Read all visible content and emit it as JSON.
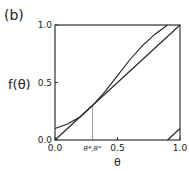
{
  "chart_data": {
    "type": "line",
    "panel_label": "(b)",
    "title": "",
    "xlabel": "θ",
    "ylabel": "f(θ)",
    "xlim": [
      0.0,
      1.0
    ],
    "ylim": [
      0.0,
      1.0
    ],
    "xticks": [
      {
        "v": 0.0,
        "label": "0.0"
      },
      {
        "v": 0.5,
        "label": "0.5"
      },
      {
        "v": 1.0,
        "label": "1.0"
      }
    ],
    "yticks": [
      {
        "v": 0.0,
        "label": "0.0"
      },
      {
        "v": 0.5,
        "label": "0.5"
      },
      {
        "v": 1.0,
        "label": "1.0"
      }
    ],
    "grid": false,
    "annotation": {
      "label": "θ*,θ°",
      "x": 0.3,
      "y": 0.3
    },
    "series": [
      {
        "name": "diagonal",
        "x": [
          0.0,
          1.0
        ],
        "y": [
          0.0,
          1.0
        ]
      },
      {
        "name": "f-branch-1",
        "x": [
          0.0,
          0.1,
          0.2,
          0.3,
          0.4,
          0.5,
          0.6,
          0.7,
          0.8,
          0.9
        ],
        "y": [
          0.1,
          0.14,
          0.2,
          0.3,
          0.42,
          0.56,
          0.7,
          0.82,
          0.92,
          1.0
        ]
      },
      {
        "name": "f-branch-2",
        "x": [
          0.9,
          0.95,
          1.0
        ],
        "y": [
          0.0,
          0.05,
          0.1
        ]
      }
    ]
  }
}
